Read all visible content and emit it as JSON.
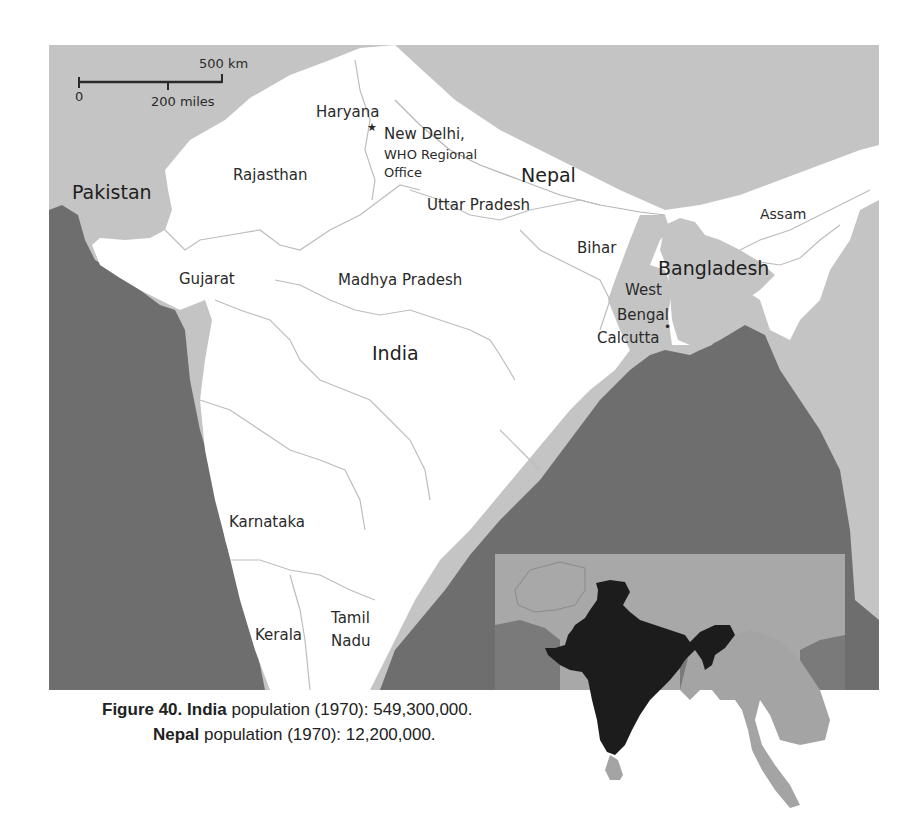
{
  "map": {
    "scale_bar": {
      "km_label": "500 km",
      "zero_label": "0",
      "miles_label": "200 miles"
    },
    "labels": {
      "pakistan": "Pakistan",
      "rajasthan": "Rajasthan",
      "haryana": "Haryana",
      "new_delhi": "New Delhi,",
      "who_line1": "WHO Regional",
      "who_line2": "Office",
      "nepal": "Nepal",
      "uttar_pradesh": "Uttar Pradesh",
      "assam": "Assam",
      "bihar": "Bihar",
      "bangladesh": "Bangladesh",
      "gujarat": "Gujarat",
      "madhya_pradesh": "Madhya Pradesh",
      "west": "West",
      "bengal": "Bengal",
      "calcutta": "Calcutta",
      "india": "India",
      "karnataka": "Karnataka",
      "tamil": "Tamil",
      "nadu": "Nadu",
      "kerala": "Kerala"
    },
    "markers": {
      "new_delhi_symbol": "★",
      "calcutta_symbol": "•"
    },
    "colors": {
      "india_land": "#ffffff",
      "neighbor_land": "#c4c4c4",
      "sea": "#6e6e6e",
      "inset_highlight": "#1c1c1c",
      "state_border": "#b5b5b5"
    }
  },
  "caption": {
    "figure_label": "Figure 40.",
    "india_name": "India",
    "india_text": " population (1970): 549,300,000.",
    "nepal_name": "Nepal",
    "nepal_text": " population (1970): 12,200,000."
  }
}
